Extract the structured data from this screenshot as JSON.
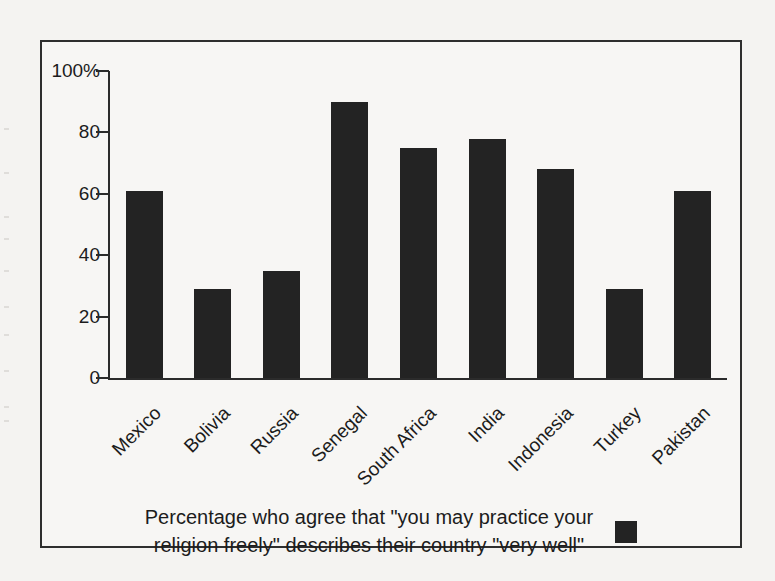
{
  "chart_data": {
    "type": "bar",
    "title": "",
    "subtitle": "",
    "xlabel": "",
    "ylabel": "",
    "ylim": [
      0,
      100
    ],
    "grid": false,
    "legend_position": "bottom-right",
    "bar_color": "#232323",
    "categories": [
      "Mexico",
      "Bolivia",
      "Russia",
      "Senegal",
      "South Africa",
      "India",
      "Indonesia",
      "Turkey",
      "Pakistan"
    ],
    "values": [
      61,
      29,
      35,
      90,
      75,
      78,
      68,
      29,
      61
    ],
    "y_ticks": [
      0,
      20,
      40,
      60,
      80,
      100
    ],
    "y_tick_labels": [
      "0",
      "20",
      "40",
      "60",
      "80",
      "100%"
    ],
    "legend": [
      {
        "label": "Percentage who agree that \"you may practice your religion freely\" describes their country \"very well\"",
        "color": "#232323"
      }
    ],
    "annotations": []
  },
  "caption": {
    "line1": "Percentage who agree that \"you may practice your",
    "line2": "religion freely\" describes their country \"very well\""
  },
  "colors": {
    "bar": "#232323",
    "axis": "#2b2b2b",
    "frame": "#2e2e2e",
    "page_background": "#f4f3f1",
    "figure_background": "#f7f6f4",
    "text": "#1c1c1c"
  }
}
